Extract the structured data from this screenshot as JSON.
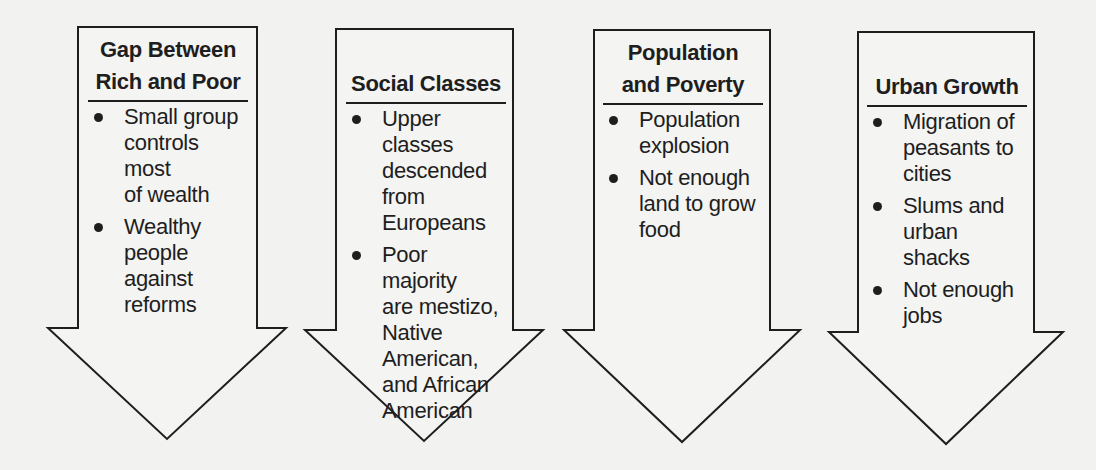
{
  "diagram": {
    "colors": {
      "background": "#f2f2f0",
      "stroke": "#1e1e1e",
      "arrow_fill": "#f4f4f2"
    },
    "arrows": [
      {
        "title_lines": [
          "Gap Between",
          "Rich and Poor"
        ],
        "items": [
          {
            "lines": [
              "Small group",
              "controls most",
              "of wealth"
            ]
          },
          {
            "lines": [
              "Wealthy",
              "people",
              "against",
              "reforms"
            ]
          }
        ]
      },
      {
        "title_lines": [
          "",
          "Social Classes"
        ],
        "items": [
          {
            "lines": [
              "Upper classes",
              "descended",
              "from",
              "Europeans"
            ]
          },
          {
            "lines": [
              "Poor majority",
              "are mestizo,",
              "Native",
              "American,",
              "and African",
              "American"
            ]
          }
        ]
      },
      {
        "title_lines": [
          "Population",
          "and Poverty"
        ],
        "items": [
          {
            "lines": [
              "Population",
              "explosion"
            ]
          },
          {
            "lines": [
              "Not enough",
              "land to grow",
              "food"
            ]
          }
        ]
      },
      {
        "title_lines": [
          "",
          "Urban Growth"
        ],
        "items": [
          {
            "lines": [
              "Migration of",
              "peasants to",
              "cities"
            ]
          },
          {
            "lines": [
              "Slums and",
              "urban shacks"
            ]
          },
          {
            "lines": [
              "Not enough",
              "jobs"
            ]
          }
        ]
      }
    ]
  }
}
